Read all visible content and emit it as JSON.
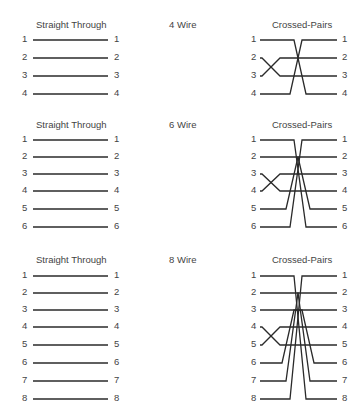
{
  "diagram": {
    "sections": [
      {
        "name": "4 Wire",
        "straight_title": "Straight Through",
        "crossed_title": "Crossed-Pairs",
        "pins": [
          "1",
          "2",
          "3",
          "4"
        ],
        "straight_mapping": [
          [
            1,
            1
          ],
          [
            2,
            2
          ],
          [
            3,
            3
          ],
          [
            4,
            4
          ]
        ],
        "crossed_mapping": [
          [
            1,
            4
          ],
          [
            2,
            3
          ],
          [
            3,
            2
          ],
          [
            4,
            1
          ]
        ]
      },
      {
        "name": "6 Wire",
        "straight_title": "Straight Through",
        "crossed_title": "Crossed-Pairs",
        "pins": [
          "1",
          "2",
          "3",
          "4",
          "5",
          "6"
        ],
        "straight_mapping": [
          [
            1,
            1
          ],
          [
            2,
            2
          ],
          [
            3,
            3
          ],
          [
            4,
            4
          ],
          [
            5,
            5
          ],
          [
            6,
            6
          ]
        ],
        "crossed_mapping": [
          [
            1,
            6
          ],
          [
            2,
            5
          ],
          [
            3,
            4
          ],
          [
            4,
            3
          ],
          [
            5,
            2
          ],
          [
            6,
            1
          ]
        ]
      },
      {
        "name": "8 Wire",
        "straight_title": "Straight Through",
        "crossed_title": "Crossed-Pairs",
        "pins": [
          "1",
          "2",
          "3",
          "4",
          "5",
          "6",
          "7",
          "8"
        ],
        "straight_mapping": [
          [
            1,
            1
          ],
          [
            2,
            2
          ],
          [
            3,
            3
          ],
          [
            4,
            4
          ],
          [
            5,
            5
          ],
          [
            6,
            6
          ],
          [
            7,
            7
          ],
          [
            8,
            8
          ]
        ],
        "crossed_mapping": [
          [
            1,
            8
          ],
          [
            2,
            7
          ],
          [
            3,
            6
          ],
          [
            4,
            5
          ],
          [
            5,
            4
          ],
          [
            6,
            3
          ],
          [
            7,
            2
          ],
          [
            8,
            1
          ]
        ]
      }
    ]
  }
}
